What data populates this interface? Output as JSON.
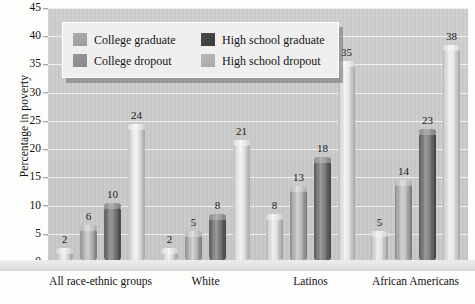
{
  "chart_data": {
    "type": "bar",
    "title": "",
    "xlabel": "",
    "ylabel": "Percentage in poverty",
    "ylim": [
      0,
      45
    ],
    "ytick_step": 5,
    "yticks": [
      45,
      40,
      35,
      30,
      25,
      20,
      15,
      10,
      5,
      0
    ],
    "grid": true,
    "legend_position": "top-left-inside",
    "categories": [
      "All race-ethnic groups",
      "White",
      "Latinos",
      "African Americans"
    ],
    "series": [
      {
        "name": "College graduate",
        "values": [
          2,
          2,
          8,
          5
        ],
        "color": "#d2d2d2"
      },
      {
        "name": "College dropout",
        "values": [
          6,
          5,
          13,
          14
        ],
        "color": "#a9a9a9"
      },
      {
        "name": "High school graduate",
        "values": [
          10,
          8,
          18,
          23
        ],
        "color": "#5c5c5c"
      },
      {
        "name": "High school dropout",
        "values": [
          24,
          21,
          35,
          38
        ],
        "color": "#e0e0e0"
      }
    ],
    "data_labels": [
      [
        "2",
        "6",
        "10",
        "24"
      ],
      [
        "2",
        "5",
        "8",
        "21"
      ],
      [
        "8",
        "13",
        "18",
        "35"
      ],
      [
        "5",
        "14",
        "23",
        "38"
      ]
    ]
  },
  "legend": {
    "entries": [
      {
        "label": "College graduate"
      },
      {
        "label": "College dropout"
      },
      {
        "label": "High school graduate"
      },
      {
        "label": "High school dropout"
      }
    ]
  },
  "axes": {
    "y_title": "Percentage in poverty",
    "y_labels": [
      "45",
      "40",
      "35",
      "30",
      "25",
      "20",
      "15",
      "10",
      "5",
      "0"
    ],
    "x_labels": [
      "All race-ethnic groups",
      "White",
      "Latinos",
      "African Americans"
    ]
  }
}
